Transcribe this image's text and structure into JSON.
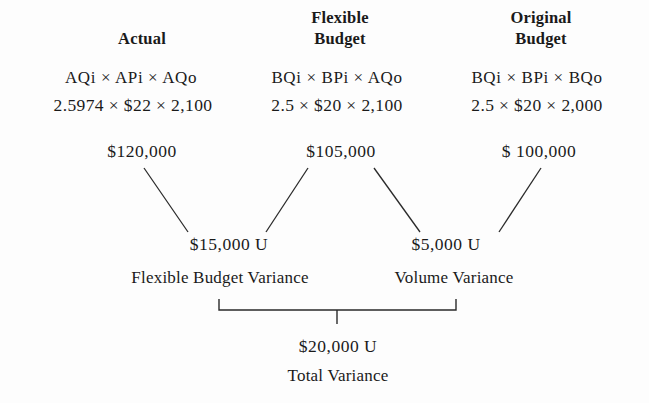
{
  "diagram": {
    "title_semantic": "Variance Analysis Three-Column Diagram",
    "background_color": "#fdfdfd",
    "line_color": "#2a2a2a",
    "columns": [
      {
        "id": "actual",
        "header_line1": "Actual",
        "header_line2": "",
        "formula": "AQi × APi × AQo",
        "numbers": "2.5974 × $22 × 2,100",
        "amount": "$120,000",
        "center_x": 142
      },
      {
        "id": "flexible-budget",
        "header_line1": "Flexible",
        "header_line2": "Budget",
        "formula": "BQi × BPi × AQo",
        "numbers": "2.5 × $20 × 2,100",
        "amount": "$105,000",
        "center_x": 340
      },
      {
        "id": "original-budget",
        "header_line1": "Original",
        "header_line2": "Budget",
        "formula": "BQi × BPi × BQo",
        "numbers": "2.5 × $20 × 2,000",
        "amount": "$ 100,000",
        "center_x": 538
      }
    ],
    "variances": [
      {
        "id": "flexible-budget-variance",
        "amount": "$15,000 U",
        "label": "Flexible Budget Variance",
        "center_x": 229,
        "label_center_x": 220
      },
      {
        "id": "volume-variance",
        "amount": "$5,000 U",
        "label": "Volume Variance",
        "center_x": 446,
        "label_center_x": 454
      }
    ],
    "total": {
      "id": "total-variance",
      "amount": "$20,000 U",
      "label": "Total Variance",
      "center_x": 338
    }
  }
}
